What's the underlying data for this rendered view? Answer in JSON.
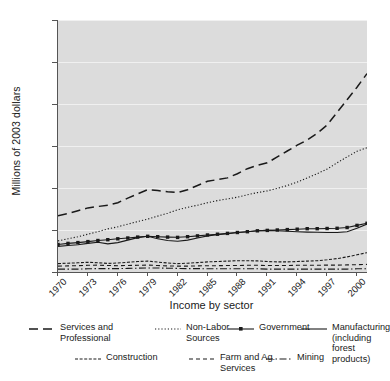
{
  "chart_data": {
    "type": "line",
    "title": "",
    "xlabel": "Income by sector",
    "ylabel": "Millions of 2003 dollars",
    "ylim": [
      0,
      1200
    ],
    "xlim": [
      1970,
      2001
    ],
    "grid": true,
    "legend_position": "bottom",
    "ytick_labels": [
      "0",
      "200",
      "400",
      "600",
      "800",
      "1,000",
      "1,200"
    ],
    "ytick_values": [
      0,
      200,
      400,
      600,
      800,
      1000,
      1200
    ],
    "xtick_labels": [
      "1970",
      "1973",
      "1976",
      "1979",
      "1982",
      "1985",
      "1988",
      "1991",
      "1994",
      "1997",
      "2000"
    ],
    "xtick_values": [
      1970,
      1973,
      1976,
      1979,
      1982,
      1985,
      1988,
      1991,
      1994,
      1997,
      2000
    ],
    "x": [
      1970,
      1971,
      1972,
      1973,
      1974,
      1975,
      1976,
      1977,
      1978,
      1979,
      1980,
      1981,
      1982,
      1983,
      1984,
      1985,
      1986,
      1987,
      1988,
      1989,
      1990,
      1991,
      1992,
      1993,
      1994,
      1995,
      1996,
      1997,
      1998,
      1999,
      2000,
      2001
    ],
    "series": [
      {
        "name": "Services and Professional",
        "style": "long-dash",
        "values": [
          268,
          278,
          292,
          305,
          312,
          318,
          330,
          352,
          372,
          392,
          388,
          382,
          378,
          392,
          412,
          432,
          440,
          448,
          468,
          492,
          508,
          520,
          548,
          576,
          604,
          628,
          660,
          700,
          760,
          820,
          880,
          945
        ]
      },
      {
        "name": "Non-Labor Sources",
        "style": "dotted",
        "values": [
          148,
          158,
          168,
          180,
          192,
          205,
          215,
          228,
          240,
          252,
          266,
          280,
          296,
          308,
          318,
          330,
          340,
          348,
          356,
          368,
          378,
          386,
          398,
          412,
          428,
          448,
          468,
          490,
          520,
          548,
          575,
          592
        ]
      },
      {
        "name": "Government",
        "style": "line-marker",
        "values": [
          131,
          136,
          140,
          145,
          150,
          154,
          158,
          162,
          166,
          170,
          168,
          166,
          165,
          168,
          172,
          176,
          180,
          184,
          188,
          192,
          196,
          198,
          200,
          202,
          204,
          206,
          206,
          207,
          208,
          212,
          222,
          232
        ]
      },
      {
        "name": "Manufacturing (including forest products)",
        "style": "solid",
        "values": [
          122,
          126,
          130,
          136,
          142,
          134,
          140,
          152,
          164,
          170,
          158,
          150,
          146,
          152,
          162,
          172,
          178,
          182,
          188,
          192,
          196,
          198,
          196,
          194,
          192,
          190,
          189,
          188,
          188,
          192,
          208,
          228
        ]
      },
      {
        "name": "Construction",
        "style": "wave",
        "values": [
          40,
          42,
          44,
          46,
          44,
          41,
          43,
          46,
          50,
          52,
          47,
          43,
          40,
          42,
          45,
          48,
          50,
          52,
          54,
          54,
          53,
          50,
          48,
          48,
          50,
          52,
          54,
          58,
          64,
          72,
          82,
          92
        ]
      },
      {
        "name": "Farm and Ag. Services",
        "style": "dash",
        "values": [
          28,
          29,
          30,
          32,
          33,
          31,
          30,
          31,
          32,
          33,
          31,
          29,
          28,
          28,
          29,
          30,
          30,
          31,
          31,
          32,
          32,
          31,
          31,
          31,
          32,
          32,
          32,
          33,
          33,
          34,
          35,
          36
        ]
      },
      {
        "name": "Mining",
        "style": "dash-dot",
        "values": [
          14,
          14,
          14,
          15,
          16,
          16,
          16,
          17,
          18,
          19,
          19,
          18,
          17,
          16,
          16,
          15,
          15,
          15,
          15,
          15,
          15,
          14,
          14,
          14,
          14,
          14,
          14,
          14,
          14,
          14,
          15,
          15
        ]
      }
    ]
  },
  "legend": {
    "row1": [
      {
        "label": "Services and\nProfessional",
        "key": "long-dash"
      },
      {
        "label": "Non-Labor\nSources",
        "key": "dotted"
      },
      {
        "label": "Government",
        "key": "line-marker"
      },
      {
        "label": "Manufacturing\n(including forest\nproducts)",
        "key": "solid"
      }
    ],
    "row2": [
      {
        "label": "Construction",
        "key": "wave"
      },
      {
        "label": "Farm and Ag.\nServices",
        "key": "dash"
      },
      {
        "label": "Mining",
        "key": "dash-dot"
      }
    ]
  },
  "colors": {
    "plot_background": "#dcdcdc",
    "page_background": "#ffffff",
    "axis": "#555555",
    "gridline": "#f0f0f0",
    "series_line": "#1a1a1a"
  }
}
